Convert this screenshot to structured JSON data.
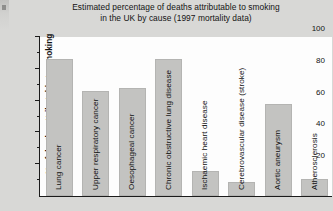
{
  "chart_data": {
    "type": "bar",
    "title": "Estimated percentage of deaths attributable to smoking in the UK by cause (1997 mortality data)",
    "title_line1": "Estimated percentage of deaths attributable to smoking",
    "title_line2": "in the UK by cause (1997 mortality data)",
    "xlabel": "",
    "ylabel": "% of deaths attributable to smoking",
    "ylim": [
      0,
      100
    ],
    "ytick_labels": [
      "100",
      "80",
      "60",
      "40",
      "20"
    ],
    "ytick_values": [
      100,
      80,
      60,
      40,
      20
    ],
    "minor_tick_values": [
      90,
      70,
      50,
      30,
      10
    ],
    "grid": false,
    "legend": false,
    "bar_color": "#c3c3c1",
    "axis_color": "#1b1b1b",
    "background_color": "#d8d8d6",
    "plot_background_color": "#fdfdfd",
    "categories": [
      "Lung cancer",
      "Upper respiratory cancer",
      "Oesophageal cancer",
      "Chronic obstructive lung disease",
      "Ischaemic heart disease",
      "Cerebrovascular disease (stroke)",
      "Aortic aneurysm",
      "Atherosclerosis"
    ],
    "values": [
      86,
      66,
      68,
      86,
      16,
      9,
      58,
      11
    ]
  }
}
